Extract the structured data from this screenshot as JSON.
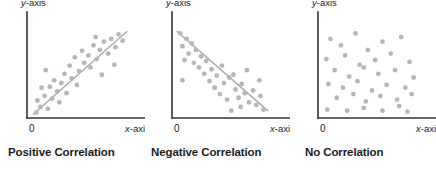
{
  "figure": {
    "background": "#ffffff",
    "panel_count": 3
  },
  "style": {
    "dot_color": "#b6b6b6",
    "axis_color": "#333333",
    "trend_line_color": "#a9a9a9",
    "caption_color": "#1c1c1c",
    "label_color": "#1c1c1c",
    "dot_radius": 2.4,
    "axis_width": 1.6,
    "trend_width": 1.4
  },
  "labels": {
    "y_axis": "y-axis",
    "x_axis": "x-axis",
    "origin": "0"
  },
  "chart_data": [
    {
      "type": "scatter",
      "title": "Positive Correlation",
      "xlabel": "x-axis",
      "ylabel": "y-axis",
      "xlim": [
        0,
        100
      ],
      "ylim": [
        0,
        100
      ],
      "grid": false,
      "legend": "none",
      "origin_tick": "0",
      "trend_line": {
        "present": true,
        "direction": "positive",
        "x": [
          6,
          96
        ],
        "y": [
          4,
          94
        ]
      },
      "points": [
        {
          "x": 9,
          "y": 6
        },
        {
          "x": 13,
          "y": 12
        },
        {
          "x": 10,
          "y": 19
        },
        {
          "x": 20,
          "y": 10
        },
        {
          "x": 17,
          "y": 24
        },
        {
          "x": 24,
          "y": 21
        },
        {
          "x": 14,
          "y": 33
        },
        {
          "x": 22,
          "y": 34
        },
        {
          "x": 29,
          "y": 29
        },
        {
          "x": 26,
          "y": 41
        },
        {
          "x": 33,
          "y": 38
        },
        {
          "x": 31,
          "y": 17
        },
        {
          "x": 38,
          "y": 27
        },
        {
          "x": 18,
          "y": 52
        },
        {
          "x": 36,
          "y": 48
        },
        {
          "x": 43,
          "y": 43
        },
        {
          "x": 41,
          "y": 57
        },
        {
          "x": 48,
          "y": 36
        },
        {
          "x": 50,
          "y": 51
        },
        {
          "x": 46,
          "y": 66
        },
        {
          "x": 55,
          "y": 60
        },
        {
          "x": 53,
          "y": 73
        },
        {
          "x": 61,
          "y": 55
        },
        {
          "x": 59,
          "y": 68
        },
        {
          "x": 64,
          "y": 79
        },
        {
          "x": 67,
          "y": 64
        },
        {
          "x": 70,
          "y": 74
        },
        {
          "x": 66,
          "y": 88
        },
        {
          "x": 74,
          "y": 83
        },
        {
          "x": 78,
          "y": 70
        },
        {
          "x": 81,
          "y": 86
        },
        {
          "x": 85,
          "y": 77
        },
        {
          "x": 88,
          "y": 91
        },
        {
          "x": 92,
          "y": 84
        },
        {
          "x": 72,
          "y": 47
        },
        {
          "x": 84,
          "y": 58
        }
      ]
    },
    {
      "type": "scatter",
      "title": "Negative Correlation",
      "xlabel": "x-axis",
      "ylabel": "y-axis",
      "xlim": [
        0,
        100
      ],
      "ylim": [
        0,
        100
      ],
      "grid": false,
      "legend": "none",
      "origin_tick": "0",
      "trend_line": {
        "present": true,
        "direction": "negative",
        "x": [
          5,
          92
        ],
        "y": [
          94,
          8
        ]
      },
      "points": [
        {
          "x": 8,
          "y": 92
        },
        {
          "x": 14,
          "y": 86
        },
        {
          "x": 10,
          "y": 78
        },
        {
          "x": 19,
          "y": 81
        },
        {
          "x": 16,
          "y": 70
        },
        {
          "x": 23,
          "y": 74
        },
        {
          "x": 12,
          "y": 63
        },
        {
          "x": 21,
          "y": 60
        },
        {
          "x": 28,
          "y": 67
        },
        {
          "x": 26,
          "y": 55
        },
        {
          "x": 33,
          "y": 62
        },
        {
          "x": 31,
          "y": 48
        },
        {
          "x": 38,
          "y": 53
        },
        {
          "x": 10,
          "y": 41
        },
        {
          "x": 36,
          "y": 40
        },
        {
          "x": 43,
          "y": 46
        },
        {
          "x": 41,
          "y": 33
        },
        {
          "x": 48,
          "y": 57
        },
        {
          "x": 50,
          "y": 38
        },
        {
          "x": 46,
          "y": 26
        },
        {
          "x": 55,
          "y": 44
        },
        {
          "x": 53,
          "y": 20
        },
        {
          "x": 61,
          "y": 31
        },
        {
          "x": 59,
          "y": 47
        },
        {
          "x": 64,
          "y": 22
        },
        {
          "x": 67,
          "y": 37
        },
        {
          "x": 70,
          "y": 27
        },
        {
          "x": 66,
          "y": 12
        },
        {
          "x": 74,
          "y": 17
        },
        {
          "x": 78,
          "y": 30
        },
        {
          "x": 81,
          "y": 14
        },
        {
          "x": 85,
          "y": 24
        },
        {
          "x": 88,
          "y": 9
        },
        {
          "x": 72,
          "y": 52
        },
        {
          "x": 84,
          "y": 41
        },
        {
          "x": 57,
          "y": 8
        }
      ]
    },
    {
      "type": "scatter",
      "title": "No Correlation",
      "xlabel": "x-axis",
      "ylabel": "y-axis",
      "xlim": [
        0,
        100
      ],
      "ylim": [
        0,
        100
      ],
      "grid": false,
      "legend": "none",
      "origin_tick": "0",
      "trend_line": {
        "present": false
      },
      "points": [
        {
          "x": 12,
          "y": 86
        },
        {
          "x": 22,
          "y": 79
        },
        {
          "x": 36,
          "y": 92
        },
        {
          "x": 48,
          "y": 74
        },
        {
          "x": 62,
          "y": 83
        },
        {
          "x": 80,
          "y": 88
        },
        {
          "x": 8,
          "y": 64
        },
        {
          "x": 26,
          "y": 68
        },
        {
          "x": 40,
          "y": 58
        },
        {
          "x": 55,
          "y": 63
        },
        {
          "x": 70,
          "y": 70
        },
        {
          "x": 88,
          "y": 61
        },
        {
          "x": 16,
          "y": 52
        },
        {
          "x": 30,
          "y": 45
        },
        {
          "x": 44,
          "y": 55
        },
        {
          "x": 58,
          "y": 48
        },
        {
          "x": 74,
          "y": 52
        },
        {
          "x": 92,
          "y": 44
        },
        {
          "x": 10,
          "y": 37
        },
        {
          "x": 24,
          "y": 33
        },
        {
          "x": 38,
          "y": 40
        },
        {
          "x": 52,
          "y": 30
        },
        {
          "x": 66,
          "y": 36
        },
        {
          "x": 84,
          "y": 33
        },
        {
          "x": 18,
          "y": 22
        },
        {
          "x": 34,
          "y": 26
        },
        {
          "x": 46,
          "y": 18
        },
        {
          "x": 60,
          "y": 24
        },
        {
          "x": 76,
          "y": 20
        },
        {
          "x": 90,
          "y": 26
        },
        {
          "x": 9,
          "y": 9
        },
        {
          "x": 28,
          "y": 8
        },
        {
          "x": 44,
          "y": 11
        },
        {
          "x": 62,
          "y": 8
        },
        {
          "x": 78,
          "y": 13
        },
        {
          "x": 86,
          "y": 7
        }
      ]
    }
  ]
}
